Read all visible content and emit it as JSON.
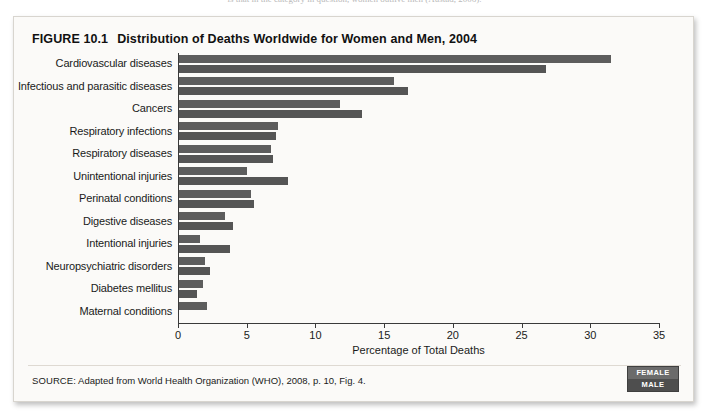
{
  "page_remnant": "is that in the category in question, women outlive men (Austad, 2006).",
  "figure": {
    "number_label": "FIGURE 10.1",
    "title": "Distribution of Deaths Worldwide for Women and Men, 2004",
    "source_prefix": "SOURCE:",
    "source_text": "Adapted from World Health Organization (WHO), 2008, p. 10, Fig. 4."
  },
  "legend": {
    "female_label": "FEMALE",
    "male_label": "MALE",
    "female_color": "#6b6b6b",
    "male_color": "#4e4e4e"
  },
  "chart_data": {
    "type": "bar",
    "orientation": "horizontal",
    "title": "Distribution of Deaths Worldwide for Women and Men, 2004",
    "xlabel": "Percentage of Total Deaths",
    "ylabel": "",
    "xlim": [
      0,
      35
    ],
    "xticks": [
      0,
      5,
      10,
      15,
      20,
      25,
      30,
      35
    ],
    "xtick_labels": [
      "0",
      "5",
      "10",
      "15",
      "20",
      "25",
      "30",
      "35"
    ],
    "grid": false,
    "legend_position": "bottom-right",
    "categories": [
      "Cardiovascular diseases",
      "Infectious and parasitic diseases",
      "Cancers",
      "Respiratory infections",
      "Respiratory diseases",
      "Unintentional injuries",
      "Perinatal conditions",
      "Digestive diseases",
      "Intentional injuries",
      "Neuropsychiatric disorders",
      "Diabetes mellitus",
      "Maternal conditions"
    ],
    "series": [
      {
        "name": "FEMALE",
        "color": "#5d5d5d",
        "values": [
          31.5,
          15.7,
          11.8,
          7.3,
          6.8,
          5.0,
          5.3,
          3.4,
          1.6,
          2.0,
          1.8,
          2.1
        ]
      },
      {
        "name": "MALE",
        "color": "#555555",
        "values": [
          26.8,
          16.7,
          13.4,
          7.1,
          6.9,
          8.0,
          5.5,
          4.0,
          3.8,
          2.3,
          1.4,
          0
        ]
      }
    ],
    "units": "percent"
  }
}
